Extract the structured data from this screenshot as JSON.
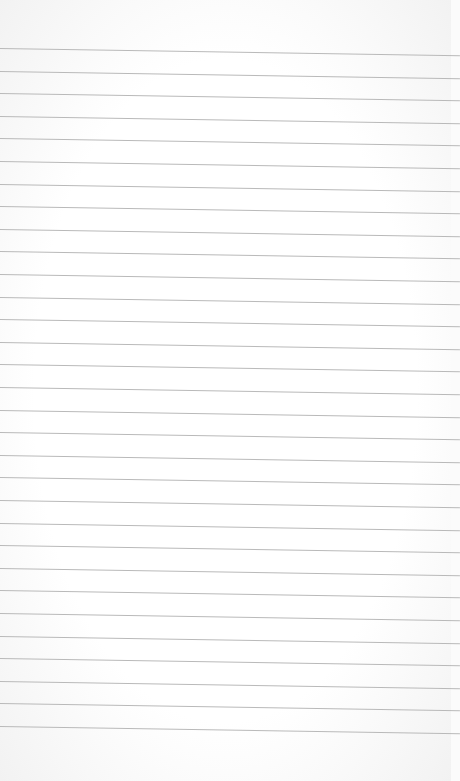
{
  "paper": {
    "type": "lined paper",
    "background_color": "#ffffff",
    "line_color": "#b9b9b9",
    "line_count": 31,
    "first_line_y": 48,
    "line_spacing": 22.6,
    "text": ""
  }
}
